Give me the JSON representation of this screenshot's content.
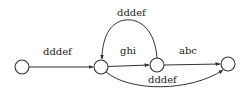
{
  "diagram": {
    "type": "state-diagram",
    "nodes": [
      {
        "id": "n1",
        "cx": 22,
        "cy": 67
      },
      {
        "id": "n2",
        "cx": 101,
        "cy": 67
      },
      {
        "id": "n3",
        "cx": 157,
        "cy": 65
      },
      {
        "id": "n4",
        "cx": 228,
        "cy": 64
      }
    ],
    "edges": [
      {
        "from": "n1",
        "to": "n2",
        "label": "dddef"
      },
      {
        "from": "n3",
        "to": "n2",
        "label": "dddef",
        "shape": "arc-over"
      },
      {
        "from": "n2",
        "to": "n3",
        "label": "ghi"
      },
      {
        "from": "n3",
        "to": "n4",
        "label": "abc"
      },
      {
        "from": "n2",
        "to": "n4",
        "label": "dddef",
        "shape": "arc-under"
      }
    ],
    "colors": {
      "stroke": "#333333",
      "background": "#ffffff"
    }
  }
}
